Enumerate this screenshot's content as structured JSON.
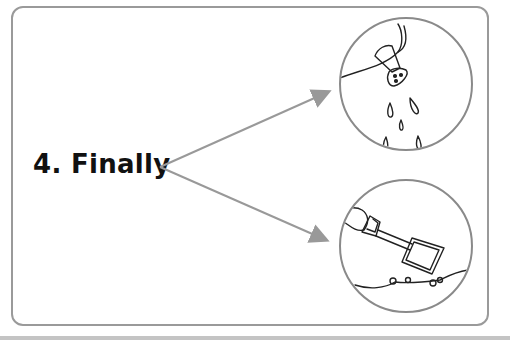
{
  "step": {
    "label": "4. Finally"
  },
  "colors": {
    "frame": "#9a9a9a",
    "arrow": "#999999",
    "circle": "#8a8a8a",
    "ink": "#222222",
    "text": "#111111"
  },
  "panels": [
    {
      "name": "watering-spout-illustration",
      "description": "spout sprinkling water droplets"
    },
    {
      "name": "shovel-illustration",
      "description": "hand holding shovel above soil with seeds"
    }
  ]
}
